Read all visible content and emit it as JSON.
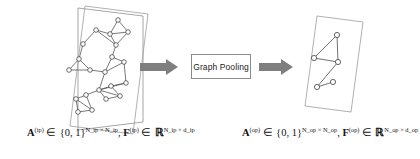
{
  "figure": {
    "background_color": "#ffffff",
    "stroke_color": "#4d4d4d",
    "arrow_color": "#808080",
    "text_color": "#121212"
  },
  "process_box": {
    "label": "Graph Pooling",
    "border_color": "#8a8a8a",
    "fill_color": "#ffffff"
  },
  "arrows": [
    {
      "name": "arrow-input-to-pooling",
      "direction": "right",
      "color": "#808080"
    },
    {
      "name": "arrow-pooling-to-output",
      "direction": "right",
      "color": "#808080"
    }
  ],
  "input_graph": {
    "caption": {
      "adjacency_symbol": "A",
      "adjacency_superscript": "(ip)",
      "adjacency_membership": "∈",
      "adjacency_set": "{0, 1}",
      "adjacency_dims": "N_ip × N_ip",
      "separator": ",",
      "feature_symbol": "F",
      "feature_superscript": "(ip)",
      "feature_membership": "∈",
      "feature_set": "ℝ",
      "feature_dims": "N_ip × d_ip"
    },
    "node_count": 21,
    "edge_count": 32,
    "nodes": [
      {
        "id": "n0",
        "x": 118,
        "y": 20
      },
      {
        "id": "n1",
        "x": 128,
        "y": 32
      },
      {
        "id": "n2",
        "x": 110,
        "y": 34
      },
      {
        "id": "n3",
        "x": 116,
        "y": 45
      },
      {
        "id": "n4",
        "x": 96,
        "y": 30
      },
      {
        "id": "n5",
        "x": 83,
        "y": 44
      },
      {
        "id": "n6",
        "x": 112,
        "y": 57
      },
      {
        "id": "n7",
        "x": 124,
        "y": 62
      },
      {
        "id": "n8",
        "x": 79,
        "y": 59
      },
      {
        "id": "n9",
        "x": 69,
        "y": 70
      },
      {
        "id": "n10",
        "x": 90,
        "y": 70
      },
      {
        "id": "n11",
        "x": 105,
        "y": 72
      },
      {
        "id": "n12",
        "x": 126,
        "y": 83
      },
      {
        "id": "n13",
        "x": 111,
        "y": 86
      },
      {
        "id": "n14",
        "x": 99,
        "y": 90
      },
      {
        "id": "n15",
        "x": 120,
        "y": 96
      },
      {
        "id": "n16",
        "x": 106,
        "y": 99
      },
      {
        "id": "n17",
        "x": 86,
        "y": 95
      },
      {
        "id": "n18",
        "x": 76,
        "y": 99
      },
      {
        "id": "n19",
        "x": 92,
        "y": 110
      },
      {
        "id": "n20",
        "x": 78,
        "y": 112
      }
    ],
    "edges": [
      [
        "n0",
        "n1"
      ],
      [
        "n0",
        "n2"
      ],
      [
        "n1",
        "n2"
      ],
      [
        "n1",
        "n3"
      ],
      [
        "n2",
        "n3"
      ],
      [
        "n2",
        "n4"
      ],
      [
        "n4",
        "n5"
      ],
      [
        "n4",
        "n3"
      ],
      [
        "n3",
        "n6"
      ],
      [
        "n6",
        "n7"
      ],
      [
        "n5",
        "n8"
      ],
      [
        "n8",
        "n9"
      ],
      [
        "n8",
        "n10"
      ],
      [
        "n9",
        "n10"
      ],
      [
        "n10",
        "n11"
      ],
      [
        "n6",
        "n11"
      ],
      [
        "n11",
        "n7"
      ],
      [
        "n7",
        "n12"
      ],
      [
        "n11",
        "n14"
      ],
      [
        "n14",
        "n12"
      ],
      [
        "n14",
        "n13"
      ],
      [
        "n14",
        "n15"
      ],
      [
        "n14",
        "n16"
      ],
      [
        "n13",
        "n12"
      ],
      [
        "n13",
        "n15"
      ],
      [
        "n16",
        "n15"
      ],
      [
        "n17",
        "n14"
      ],
      [
        "n17",
        "n18"
      ],
      [
        "n17",
        "n19"
      ],
      [
        "n18",
        "n20"
      ],
      [
        "n19",
        "n20"
      ],
      [
        "n18",
        "n19"
      ]
    ]
  },
  "output_graph": {
    "caption": {
      "adjacency_symbol": "A",
      "adjacency_superscript": "(op)",
      "adjacency_membership": "∈",
      "adjacency_set": "{0, 1}",
      "adjacency_dims": "N_op × N_op",
      "separator": ",",
      "feature_symbol": "F",
      "feature_superscript": "(op)",
      "feature_membership": "∈",
      "feature_set": "ℝ",
      "feature_dims": "N_op × d_op"
    },
    "node_count": 5,
    "edge_count": 6,
    "nodes": [
      {
        "id": "m0",
        "x": 337,
        "y": 35
      },
      {
        "id": "m1",
        "x": 314,
        "y": 58
      },
      {
        "id": "m2",
        "x": 338,
        "y": 62
      },
      {
        "id": "m3",
        "x": 333,
        "y": 82
      },
      {
        "id": "m4",
        "x": 317,
        "y": 87
      }
    ],
    "edges": [
      [
        "m0",
        "m1"
      ],
      [
        "m0",
        "m2"
      ],
      [
        "m1",
        "m2"
      ],
      [
        "m2",
        "m4"
      ],
      [
        "m4",
        "m3"
      ],
      [
        "m3",
        "m4"
      ]
    ]
  }
}
